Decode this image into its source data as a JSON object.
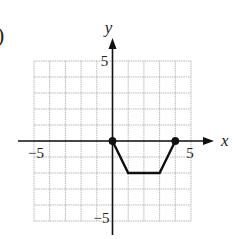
{
  "problem_marker": ")",
  "chart_data": {
    "type": "line",
    "title": "",
    "xlabel": "x",
    "ylabel": "y",
    "xlim": [
      -5,
      5
    ],
    "ylim": [
      -5,
      5
    ],
    "grid": true,
    "grid_step": 1,
    "x_tick_labels": [
      {
        "value": -5,
        "label": "−5"
      },
      {
        "value": 5,
        "label": "5"
      }
    ],
    "y_tick_labels": [
      {
        "value": 5,
        "label": "5"
      },
      {
        "value": -5,
        "label": "−5"
      }
    ],
    "series": [
      {
        "name": "f",
        "x": [
          0,
          1,
          3,
          4
        ],
        "y": [
          0,
          -2,
          -2,
          0
        ],
        "endpoints": [
          {
            "x": 0,
            "y": 0,
            "style": "filled"
          },
          {
            "x": 4,
            "y": 0,
            "style": "filled"
          }
        ]
      }
    ],
    "colors": {
      "line": "#111111",
      "grid": "#b8b8b8",
      "axis": "#111111"
    }
  }
}
